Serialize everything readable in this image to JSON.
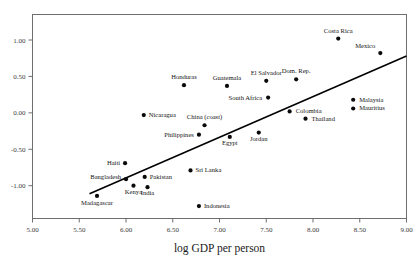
{
  "chart_data": {
    "type": "scatter",
    "title": "",
    "xlabel": "log GDP per person",
    "ylabel": "",
    "xlim": [
      5.0,
      9.0
    ],
    "ylim": [
      -1.45,
      1.35
    ],
    "grid": false,
    "legend": null,
    "xticks": [
      "5.00",
      "5.50",
      "6.00",
      "6.50",
      "7.00",
      "7.50",
      "8.00",
      "8.50",
      "9.00"
    ],
    "xtick_values": [
      5.0,
      5.5,
      6.0,
      6.5,
      7.0,
      7.5,
      8.0,
      8.5,
      9.0
    ],
    "yticks": [
      "1.00",
      "0.50",
      "0.00",
      "-0.50",
      "-1.00"
    ],
    "ytick_values": [
      1.0,
      0.5,
      0.0,
      -0.5,
      -1.0
    ],
    "marker_color": "#0a0a0a",
    "line_color": "#000000",
    "frame_color": "#6e6e6e",
    "trend_line": {
      "x0": 5.61,
      "y0": -1.11,
      "x1": 9.0,
      "y1": 0.78
    },
    "points": [
      {
        "name": "Costa Rica",
        "x": 8.27,
        "y": 1.02,
        "label_dx": 0,
        "label_dy": -6,
        "label_anchor": "middle"
      },
      {
        "name": "Mexico",
        "x": 8.72,
        "y": 0.82,
        "label_dx": -5,
        "label_dy": -5,
        "label_anchor": "end"
      },
      {
        "name": "Honduras",
        "x": 6.62,
        "y": 0.38,
        "label_dx": 0,
        "label_dy": -6,
        "label_anchor": "middle"
      },
      {
        "name": "Guatemala",
        "x": 7.08,
        "y": 0.37,
        "label_dx": 0,
        "label_dy": -6,
        "label_anchor": "middle"
      },
      {
        "name": "El Salvador",
        "x": 7.5,
        "y": 0.44,
        "label_dx": 0,
        "label_dy": -6,
        "label_anchor": "middle"
      },
      {
        "name": "Dom. Rep.",
        "x": 7.82,
        "y": 0.46,
        "label_dx": 0,
        "label_dy": -6,
        "label_anchor": "middle"
      },
      {
        "name": "South Africa",
        "x": 7.52,
        "y": 0.21,
        "label_dx": -6,
        "label_dy": 2,
        "label_anchor": "end"
      },
      {
        "name": "Malaysia",
        "x": 8.43,
        "y": 0.18,
        "label_dx": 6,
        "label_dy": 2,
        "label_anchor": "start"
      },
      {
        "name": "Mauritius",
        "x": 8.43,
        "y": 0.06,
        "label_dx": 6,
        "label_dy": 2,
        "label_anchor": "start"
      },
      {
        "name": "Colombia",
        "x": 7.75,
        "y": 0.02,
        "label_dx": 6,
        "label_dy": 2,
        "label_anchor": "start"
      },
      {
        "name": "Thailand",
        "x": 7.92,
        "y": -0.08,
        "label_dx": 6,
        "label_dy": 2,
        "label_anchor": "start"
      },
      {
        "name": "Nicaragua",
        "x": 6.19,
        "y": -0.03,
        "label_dx": 5,
        "label_dy": 2,
        "label_anchor": "start"
      },
      {
        "name": "China (coast)",
        "x": 6.84,
        "y": -0.17,
        "label_dx": 0,
        "label_dy": -6,
        "label_anchor": "middle"
      },
      {
        "name": "Philippines",
        "x": 6.78,
        "y": -0.3,
        "label_dx": -5,
        "label_dy": 2,
        "label_anchor": "end"
      },
      {
        "name": "Egypt",
        "x": 7.11,
        "y": -0.33,
        "label_dx": 0,
        "label_dy": 8,
        "label_anchor": "middle"
      },
      {
        "name": "Jordan",
        "x": 7.42,
        "y": -0.27,
        "label_dx": 0,
        "label_dy": 8,
        "label_anchor": "middle"
      },
      {
        "name": "Haiti",
        "x": 5.99,
        "y": -0.69,
        "label_dx": -5,
        "label_dy": 2,
        "label_anchor": "end"
      },
      {
        "name": "Sri Lanka",
        "x": 6.69,
        "y": -0.79,
        "label_dx": 5,
        "label_dy": 2,
        "label_anchor": "start"
      },
      {
        "name": "Bangladesh",
        "x": 6.0,
        "y": -0.91,
        "label_dx": -5,
        "label_dy": 0,
        "label_anchor": "end"
      },
      {
        "name": "Pakistan",
        "x": 6.2,
        "y": -0.88,
        "label_dx": 5,
        "label_dy": 2,
        "label_anchor": "start"
      },
      {
        "name": "Kenya",
        "x": 6.08,
        "y": -1.0,
        "label_dx": 0,
        "label_dy": 8,
        "label_anchor": "middle"
      },
      {
        "name": "India",
        "x": 6.23,
        "y": -1.02,
        "label_dx": 0,
        "label_dy": 8,
        "label_anchor": "middle"
      },
      {
        "name": "Madagascar",
        "x": 5.69,
        "y": -1.14,
        "label_dx": 0,
        "label_dy": 9,
        "label_anchor": "middle"
      },
      {
        "name": "Indonesia",
        "x": 6.78,
        "y": -1.28,
        "label_dx": 5,
        "label_dy": 2,
        "label_anchor": "start"
      }
    ]
  },
  "corner": {
    "text": ""
  }
}
